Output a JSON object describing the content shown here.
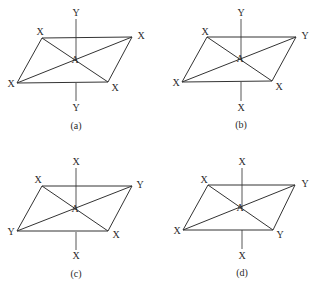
{
  "figure": {
    "panels": [
      {
        "id": "a",
        "caption": "(a)",
        "center_label": "A",
        "axis_top_label": "Y",
        "axis_bottom_label": "Y",
        "vertex_labels": {
          "top_left": "X",
          "top_right": "X",
          "bottom_left": "X",
          "bottom_right": "X"
        }
      },
      {
        "id": "b",
        "caption": "(b)",
        "center_label": "A",
        "axis_top_label": "Y",
        "axis_bottom_label": "X",
        "vertex_labels": {
          "top_left": "X",
          "top_right": "Y",
          "bottom_left": "X",
          "bottom_right": "X"
        }
      },
      {
        "id": "c",
        "caption": "(c)",
        "center_label": "A",
        "axis_top_label": "X",
        "axis_bottom_label": "X",
        "vertex_labels": {
          "top_left": "X",
          "top_right": "Y",
          "bottom_left": "Y",
          "bottom_right": "X"
        }
      },
      {
        "id": "d",
        "caption": "(d)",
        "center_label": "A",
        "axis_top_label": "X",
        "axis_bottom_label": "X",
        "vertex_labels": {
          "top_left": "X",
          "top_right": "Y",
          "bottom_left": "X",
          "bottom_right": "Y"
        }
      }
    ]
  }
}
